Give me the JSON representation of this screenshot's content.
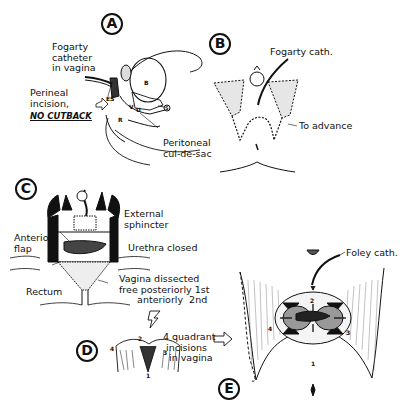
{
  "figure": {
    "panels": {
      "A": {
        "letter": "A",
        "labels": {
          "fogarty": "Fogarty\ncatheter\nin vagina",
          "perineal_l1": "Perineal\nincision,",
          "no_cutback": "NO CUTBACK",
          "peritoneal": "Peritoneal\ncul-de-sac"
        },
        "structures": {
          "bladder": "B",
          "external_sphincter": "ES",
          "vagina": "V",
          "uterus": "U",
          "rectum": "R",
          "small": "S"
        }
      },
      "B": {
        "letter": "B",
        "labels": {
          "fogarty": "Fogarty cath.",
          "advance": "To advance"
        }
      },
      "C": {
        "letter": "C",
        "labels": {
          "external_sphincter": "External\nsphincter",
          "anterior_flap": "Anterior\nflap",
          "urethra": "Urethra closed",
          "vagina": "Vagina dissected\nfree posteriorly 1st\n      anteriorly  2nd",
          "rectum": "Rectum"
        }
      },
      "D": {
        "letter": "D",
        "labels": {
          "quadrant": "4 quadrant\n incisions\n  in vagina"
        },
        "numbers": [
          "1",
          "2",
          "3",
          "4"
        ]
      },
      "E": {
        "letter": "E",
        "labels": {
          "foley": "Foley cath."
        },
        "numbers": [
          "1",
          "2",
          "3",
          "4"
        ]
      }
    }
  }
}
